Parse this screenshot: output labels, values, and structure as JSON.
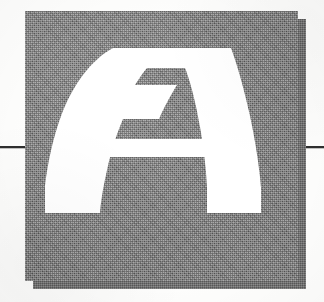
{
  "page": {
    "type": "chapter-opening-page",
    "background_color": "#fdfdfc"
  },
  "decorative_initial": {
    "letter": "A",
    "letter_color": "#ffffff",
    "block_color": "#828282",
    "shadow_color": "#6e6e6e",
    "texture": "dithered-halftone-gray",
    "description": "Large white display capital A on textured gray square with offset drop shadow"
  },
  "rules": {
    "left_label": "left-horizontal-rule",
    "right_label": "right-horizontal-rule",
    "color": "#2e2e2e"
  }
}
